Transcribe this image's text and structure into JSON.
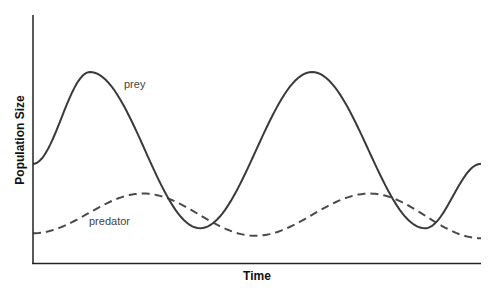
{
  "chart_data": {
    "type": "line",
    "title": "",
    "xlabel": "Time",
    "ylabel": "Population Size",
    "xlim": [
      0,
      100
    ],
    "ylim": [
      0,
      100
    ],
    "grid": false,
    "ticks": false,
    "legend": "inline labels",
    "series": [
      {
        "name": "prey",
        "style": "solid",
        "color": "#3a3a3a",
        "label_position": {
          "x": 20.5,
          "y": 72
        },
        "points": [
          {
            "x": 0,
            "y": 40
          },
          {
            "x": 12.7,
            "y": 77
          },
          {
            "x": 37.3,
            "y": 14
          },
          {
            "x": 62.3,
            "y": 77
          },
          {
            "x": 87.5,
            "y": 14
          },
          {
            "x": 100,
            "y": 40
          }
        ]
      },
      {
        "name": "predator",
        "style": "dashed",
        "color": "#4a4a4a",
        "label_position": {
          "x": 12.5,
          "y": 15.5
        },
        "points": [
          {
            "x": 0,
            "y": 12
          },
          {
            "x": 24.6,
            "y": 28
          },
          {
            "x": 49.6,
            "y": 11
          },
          {
            "x": 75.2,
            "y": 28
          },
          {
            "x": 100,
            "y": 10
          }
        ]
      }
    ]
  },
  "axes": {
    "x_title": "Time",
    "y_title": "Population Size",
    "color": "#222222"
  },
  "labels": {
    "prey": "prey",
    "predator": "predator"
  }
}
